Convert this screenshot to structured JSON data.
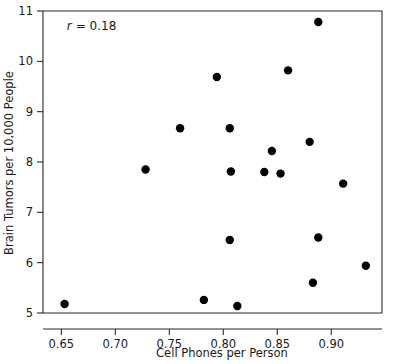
{
  "chart_data": {
    "type": "scatter",
    "title": "",
    "xlabel": "Cell Phones per Person",
    "ylabel": "Brain Tumors per 10,000 People",
    "xlim": [
      0.633,
      0.947
    ],
    "ylim": [
      5.0,
      11.0
    ],
    "xticks": [
      0.65,
      0.7,
      0.75,
      0.8,
      0.85,
      0.9
    ],
    "xticklabels": [
      "0.65",
      "0.70",
      "0.75",
      "0.80",
      "0.85",
      "0.90"
    ],
    "yticks": [
      5,
      6,
      7,
      8,
      9,
      10,
      11
    ],
    "yticklabels": [
      "5",
      "6",
      "7",
      "8",
      "9",
      "10",
      "11"
    ],
    "grid": false,
    "legend": null,
    "annotations": [
      {
        "name": "correlation-annotation",
        "symbol": "r",
        "text": "= 0.18",
        "full_text": "r = 0.18",
        "x": 0.655,
        "y": 10.62
      }
    ],
    "marker": {
      "shape": "circle",
      "color": "#000000",
      "radius_px": 4.2
    },
    "points": [
      {
        "x": 0.653,
        "y": 5.18
      },
      {
        "x": 0.728,
        "y": 7.85
      },
      {
        "x": 0.76,
        "y": 8.67
      },
      {
        "x": 0.782,
        "y": 5.26
      },
      {
        "x": 0.794,
        "y": 9.69
      },
      {
        "x": 0.806,
        "y": 8.67
      },
      {
        "x": 0.807,
        "y": 7.81
      },
      {
        "x": 0.806,
        "y": 6.45
      },
      {
        "x": 0.813,
        "y": 5.14
      },
      {
        "x": 0.838,
        "y": 7.8
      },
      {
        "x": 0.845,
        "y": 8.22
      },
      {
        "x": 0.853,
        "y": 7.77
      },
      {
        "x": 0.86,
        "y": 9.82
      },
      {
        "x": 0.88,
        "y": 8.4
      },
      {
        "x": 0.883,
        "y": 5.6
      },
      {
        "x": 0.888,
        "y": 10.78
      },
      {
        "x": 0.888,
        "y": 6.5
      },
      {
        "x": 0.911,
        "y": 7.57
      },
      {
        "x": 0.932,
        "y": 5.94
      }
    ]
  }
}
